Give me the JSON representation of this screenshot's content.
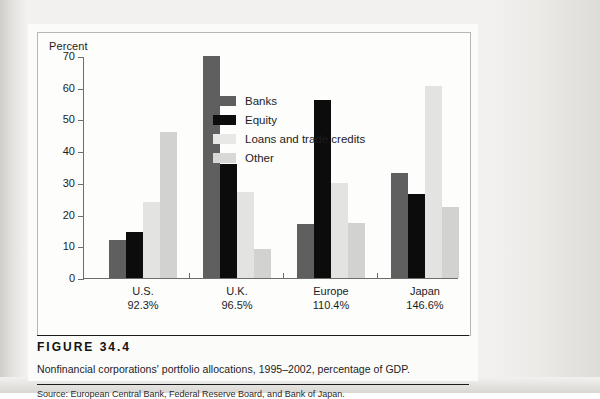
{
  "figure": {
    "number_label": "FIGURE 34.4",
    "caption": "Nonfinancial corporations' portfolio allocations, 1995–2002, percentage of GDP.",
    "source": "Source: European Central Bank, Federal Reserve Board, and Bank of Japan."
  },
  "chart_data": {
    "type": "bar",
    "title": "",
    "xlabel": "",
    "ylabel": "Percent",
    "ylim": [
      0,
      70
    ],
    "yticks": [
      0,
      10,
      20,
      30,
      40,
      50,
      60,
      70
    ],
    "ytick_labels": [
      "0",
      "10",
      "20",
      "30",
      "40",
      "50",
      "60",
      "70"
    ],
    "grid": false,
    "legend_position": "inside-top-center",
    "categories": [
      "U.S.",
      "U.K.",
      "Europe",
      "Japan"
    ],
    "category_sublabels": [
      "92.3%",
      "96.5%",
      "110.4%",
      "146.6%"
    ],
    "series": [
      {
        "name": "Banks",
        "color": "#5f5f5f",
        "values": [
          12.0,
          81.0,
          17.0,
          33.0
        ]
      },
      {
        "name": "Equity",
        "color": "#0c0c0c",
        "values": [
          14.5,
          36.0,
          56.0,
          26.5
        ]
      },
      {
        "name": "Loans and trade credits",
        "color": "#e3e3e1",
        "values": [
          24.0,
          27.0,
          30.0,
          60.5
        ]
      },
      {
        "name": "Other",
        "color": "#d2d2d0",
        "values": [
          46.0,
          9.0,
          17.5,
          22.5
        ]
      }
    ]
  },
  "legend": {
    "items": [
      {
        "label": "Banks"
      },
      {
        "label": "Equity"
      },
      {
        "label": "Loans and trade credits"
      },
      {
        "label": "Other"
      }
    ]
  }
}
